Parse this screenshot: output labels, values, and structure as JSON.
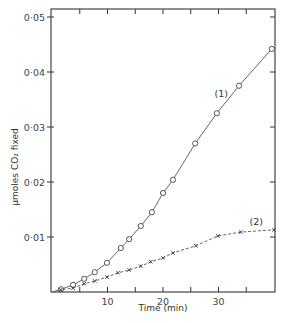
{
  "chart_data": {
    "type": "line",
    "title": "",
    "xlabel": "Time (min)",
    "ylabel": "μmoles CO₂ fixed",
    "xlim": [
      0,
      40
    ],
    "ylim": [
      0,
      0.0525
    ],
    "x_ticks": [
      10,
      20,
      30
    ],
    "x_tick_labels": [
      "10",
      "20",
      "30"
    ],
    "x_minor_ticks": [
      5,
      15,
      25,
      35
    ],
    "y_ticks": [
      0.01,
      0.02,
      0.03,
      0.04,
      0.05
    ],
    "y_tick_labels": [
      "0·01",
      "0·02",
      "0·03",
      "0·04",
      "0·05"
    ],
    "grid": false,
    "legend": "inline labels",
    "series": [
      {
        "name": "(1)",
        "marker": "circle",
        "label_pos": {
          "x": 30.5,
          "y": 0.0355
        },
        "x": [
          1.6,
          3.8,
          5.8,
          7.7,
          9.9,
          12.4,
          13.9,
          16.0,
          18.0,
          20.0,
          21.8,
          25.8,
          29.7,
          33.7,
          39.6
        ],
        "values": [
          0.0005,
          0.0013,
          0.0024,
          0.0036,
          0.0053,
          0.008,
          0.0096,
          0.012,
          0.0145,
          0.018,
          0.0204,
          0.027,
          0.0325,
          0.0375,
          0.0442
        ]
      },
      {
        "name": "(2)",
        "marker": "x",
        "label_pos": {
          "x": 36.8,
          "y": 0.0122
        },
        "x": [
          1.6,
          3.8,
          5.8,
          7.7,
          9.9,
          11.9,
          13.9,
          16.0,
          17.8,
          20.0,
          21.8,
          25.9,
          29.9,
          34.0,
          40.0
        ],
        "values": [
          0.0004,
          0.0007,
          0.0015,
          0.002,
          0.0027,
          0.0035,
          0.004,
          0.0047,
          0.0055,
          0.0062,
          0.0071,
          0.0084,
          0.0102,
          0.0109,
          0.0113
        ]
      }
    ]
  }
}
